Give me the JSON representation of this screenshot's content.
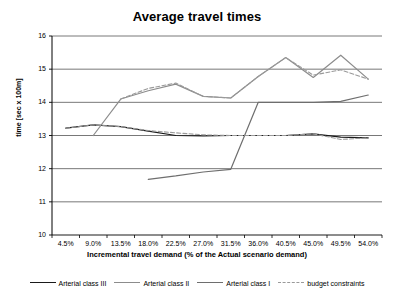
{
  "chart_data": {
    "type": "line",
    "title": "Average travel times",
    "xlabel": "Incremental travel demand (% of the Actual scenario demand)",
    "ylabel": "time [sec x 100m]",
    "ylim": [
      10,
      16
    ],
    "yticks": [
      10,
      11,
      12,
      13,
      14,
      15,
      16
    ],
    "grid": true,
    "legend_position": "bottom",
    "categories": [
      "4.5%",
      "9.0%",
      "13.5%",
      "18.0%",
      "22.5%",
      "27.0%",
      "31.5%",
      "36.0%",
      "40.5%",
      "45.0%",
      "49.5%",
      "54.0%"
    ],
    "series": [
      {
        "name": "Arterial class III",
        "color": "#1a1a1a",
        "style": "solid",
        "values": [
          13.22,
          13.32,
          13.27,
          13.13,
          13.0,
          12.99,
          13.0,
          13.0,
          13.0,
          13.05,
          12.95,
          12.93
        ]
      },
      {
        "name": "Arterial class II",
        "color": "#8c8c8c",
        "style": "solid",
        "values": [
          null,
          13.0,
          14.1,
          14.35,
          14.55,
          14.18,
          14.13,
          14.78,
          15.35,
          14.75,
          15.42,
          14.7
        ]
      },
      {
        "name": "Arterial class I",
        "color": "#6e6e6e",
        "style": "solid",
        "values": [
          null,
          null,
          null,
          11.68,
          11.78,
          11.9,
          11.98,
          14.0,
          14.0,
          14.0,
          14.03,
          14.22
        ]
      },
      {
        "name": "budget constraints",
        "color": "#9a9a9a",
        "style": "dashed",
        "values": [
          13.22,
          13.32,
          13.27,
          13.15,
          13.08,
          13.02,
          13.0,
          13.0,
          13.0,
          13.05,
          12.88,
          12.93
        ]
      },
      {
        "name": "budget constraints upper",
        "color": "#9a9a9a",
        "style": "dashed",
        "values": [
          null,
          null,
          14.1,
          14.42,
          14.58,
          14.18,
          14.13,
          14.78,
          15.35,
          14.82,
          14.98,
          14.7
        ]
      }
    ]
  },
  "legend": {
    "items": [
      {
        "label": "Arterial class III"
      },
      {
        "label": "Arterial class II"
      },
      {
        "label": "Arterial class I"
      },
      {
        "label": "budget constraints"
      }
    ]
  }
}
